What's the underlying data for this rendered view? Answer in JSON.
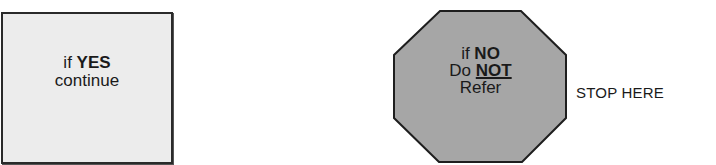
{
  "yes_box": {
    "line1_prefix": "if",
    "line1_emphasis": "YES",
    "line2": "continue",
    "fill_color": "#ececec",
    "border_color": "#2a2a2a"
  },
  "stop_sign": {
    "line1_prefix": "if",
    "line1_emphasis": "NO",
    "line2_prefix": "Do",
    "line2_emphasis": "NOT",
    "line3": "Refer",
    "fill_color": "#a6a6a6",
    "border_color": "#1e1e1e"
  },
  "stop_label": "STOP HERE"
}
